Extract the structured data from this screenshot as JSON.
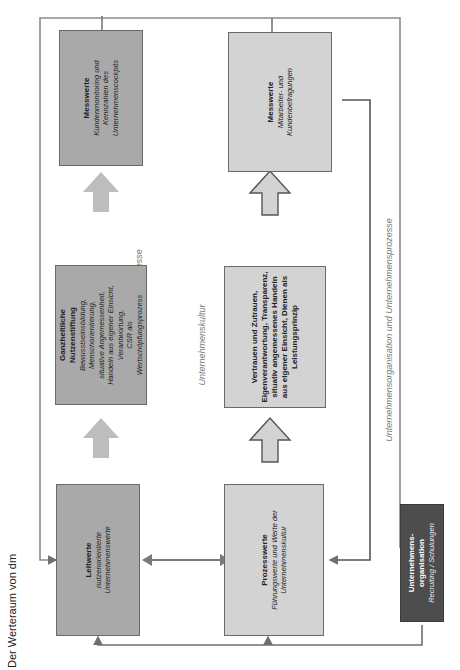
{
  "diagram": {
    "title": "Der Werteraum von dm",
    "orientation": "rotated-90-ccw",
    "section_labels": {
      "top": "Wertschöpfungsprozesse",
      "middle": "Unternehmenskultur",
      "bottom": "Unternehmensorganisation und Unternehmensprozesse"
    },
    "boxes": {
      "leitwerte": {
        "title": "Leitwerte",
        "subtitle": "nutzenorientierte Unternehmenswerte"
      },
      "ganzheitliche": {
        "title": "Ganzheitliche Nutzenstiftung",
        "lines": [
          "Bewusstseinsbildung,",
          "Menschorientierung,",
          "situative Angemessenheit,",
          "Handeln aus eigener Einsicht,",
          "Verantwortung,",
          "CSR als",
          "Wertschöpfungsprozess"
        ]
      },
      "messwerte_kunden": {
        "title": "Messwerte",
        "subtitle": "Kundenmonitoring und Kennzahlen des Unternehmenscockpits"
      },
      "prozesswerte": {
        "title": "Prozesswerte",
        "subtitle": "Führungswerte und Werte der Unternehmenskultur"
      },
      "vertrauen": {
        "text": "Vertrauen und Zutrauen, Eigenverantwortung, Transparenz, situativ angemessenes Handeln aus eigener Einsicht, Dienen als Leistungsprinzip"
      },
      "messwerte_mitarbeiter": {
        "title": "Messwerte",
        "subtitle": "Mitarbeiter- und Kundenbefragungen"
      },
      "organisation": {
        "title": "Unternehmens-organisation",
        "subtitle": "Recruiting / Schulungen"
      }
    },
    "colors": {
      "dark_box": "#a9a9a9",
      "light_box": "#d3d3d3",
      "org_box": "#4d4d4d",
      "connector": "#6f6f6f",
      "arrow_fill": "#bdbdbd"
    }
  }
}
